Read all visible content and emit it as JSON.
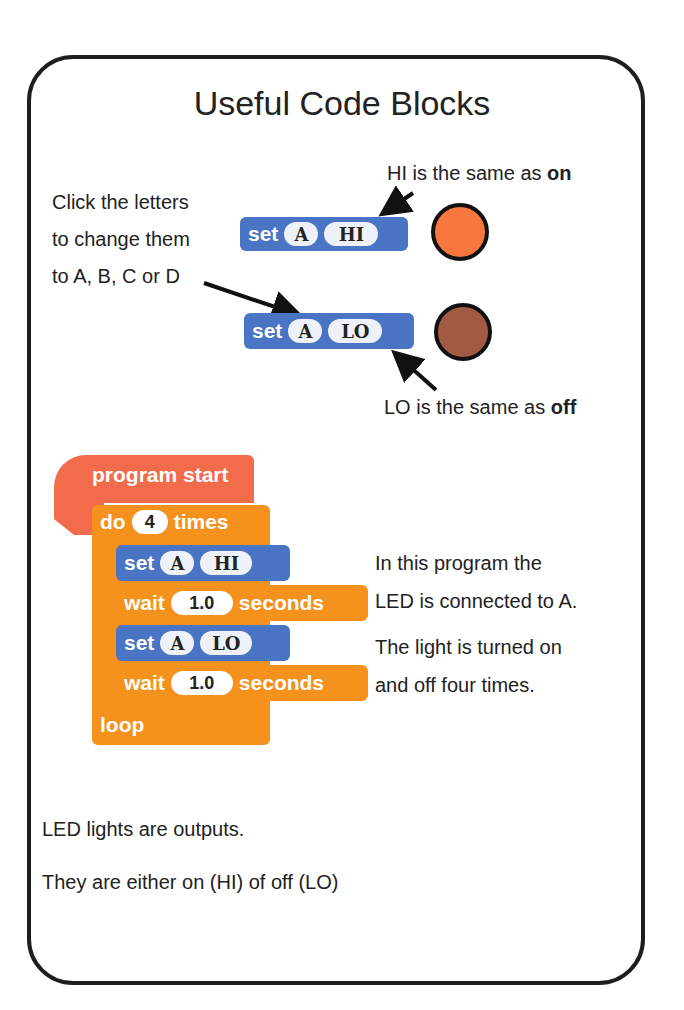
{
  "title": "Useful Code Blocks",
  "notes": {
    "hi_note": [
      "HI is the same as ",
      "on"
    ],
    "lo_note": [
      "LO is the same as ",
      "off"
    ],
    "click_letters": [
      "Click the letters",
      "to change them",
      "to A, B, C or D"
    ],
    "program_desc": [
      "In this program the",
      "LED is connected to A.",
      "The light is turned on",
      "and off four times."
    ],
    "footer": [
      "LED lights are outputs.",
      "They are either on (HI) of off (LO)"
    ]
  },
  "example_blocks": [
    {
      "label": "set",
      "pin": "A",
      "state": "HI",
      "led_color": "#f7773f"
    },
    {
      "label": "set",
      "pin": "A",
      "state": "LO",
      "led_color": "#a35a45"
    }
  ],
  "program": {
    "start_label": "program start",
    "repeat": {
      "do": "do",
      "count": "4",
      "times": "times"
    },
    "steps": [
      {
        "type": "set",
        "label": "set",
        "pin": "A",
        "state": "HI"
      },
      {
        "type": "wait",
        "label": "wait",
        "value": "1.0",
        "unit": "seconds"
      },
      {
        "type": "set",
        "label": "set",
        "pin": "A",
        "state": "LO"
      },
      {
        "type": "wait",
        "label": "wait",
        "value": "1.0",
        "unit": "seconds"
      }
    ],
    "loop_label": "loop"
  },
  "colors": {
    "set_block": "#4a74c4",
    "wait_block": "#f5921e",
    "start_block": "#f26b4b"
  }
}
